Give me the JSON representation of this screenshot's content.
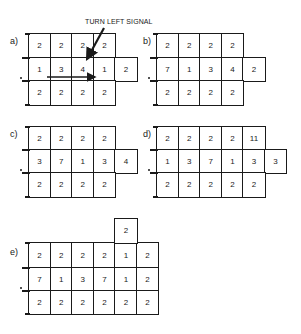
{
  "annotation": {
    "text": "TURN LEFT SIGNAL"
  },
  "panels": [
    {
      "label": "a)",
      "rows": [
        [
          "2",
          "2",
          "2",
          "2"
        ],
        [
          "1",
          "3",
          "4",
          "1",
          "2"
        ],
        [
          "2",
          "2",
          "2",
          "2"
        ]
      ]
    },
    {
      "label": "b)",
      "rows": [
        [
          "2",
          "2",
          "2",
          "2"
        ],
        [
          "7",
          "1",
          "3",
          "4",
          "2"
        ],
        [
          "2",
          "2",
          "2",
          "2"
        ]
      ]
    },
    {
      "label": "c)",
      "rows": [
        [
          "2",
          "2",
          "2",
          "2"
        ],
        [
          "3",
          "7",
          "1",
          "3",
          "4"
        ],
        [
          "2",
          "2",
          "2",
          "2"
        ]
      ]
    },
    {
      "label": "d)",
      "rows": [
        [
          "2",
          "2",
          "2",
          "2",
          "11"
        ],
        [
          "1",
          "3",
          "7",
          "1",
          "3",
          "3"
        ],
        [
          "2",
          "2",
          "2",
          "2",
          "2"
        ]
      ]
    },
    {
      "label": "e)",
      "extra_top": "2",
      "rows": [
        [
          "2",
          "2",
          "2",
          "2",
          "1",
          "2"
        ],
        [
          "7",
          "1",
          "3",
          "7",
          "1",
          "2"
        ],
        [
          "2",
          "2",
          "2",
          "2",
          "2",
          "2"
        ]
      ]
    }
  ]
}
